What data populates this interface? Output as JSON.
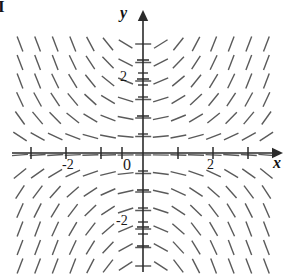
{
  "figure": {
    "tag": "I",
    "kind": "slope-field"
  },
  "axes": {
    "x_label": "x",
    "y_label": "y",
    "origin_label": "0",
    "x_ticks": [
      {
        "value": -4,
        "label": "",
        "px": 31
      },
      {
        "value": -3,
        "label": "",
        "px": 66
      },
      {
        "value": -2,
        "label": "-2",
        "px": 101
      },
      {
        "value": -1,
        "label": "",
        "px": 122
      },
      {
        "value": 1,
        "label": "",
        "px": 178
      },
      {
        "value": 2,
        "label": "2",
        "px": 213
      },
      {
        "value": 3,
        "label": "",
        "px": 248
      }
    ],
    "y_ticks": [
      {
        "value": 3,
        "label": "",
        "px": 60
      },
      {
        "value": 2,
        "label": "2",
        "px": 79
      },
      {
        "value": 1,
        "label": "",
        "px": 116
      },
      {
        "value": -1,
        "label": "",
        "px": 190
      },
      {
        "value": -2,
        "label": "-2",
        "px": 227
      },
      {
        "value": -3,
        "label": "",
        "px": 246
      }
    ],
    "x_tick_labels": [
      "-2",
      "2"
    ],
    "y_tick_labels": [
      "2",
      "-2"
    ]
  },
  "chart_data": {
    "type": "scatter",
    "subtype": "slope-field",
    "title": "",
    "xlabel": "x",
    "ylabel": "y",
    "xlim": [
      -3.6,
      3.6
    ],
    "ylim": [
      -3.2,
      3.2
    ],
    "grid": false,
    "legend": null,
    "equation_text": "dy/dx = x*y",
    "annotations": [
      "I"
    ],
    "segment_grid": {
      "x_start_px": 20,
      "x_step_px": 17.6,
      "x_count": 15,
      "y_start_px": 44,
      "y_step_px": 18.5,
      "y_count": 13,
      "segment_half_length_px": 8.0,
      "color": "#5a5a5a",
      "line_width": 1.4,
      "origin_px": {
        "x": 143,
        "y": 153
      },
      "scale_px_per_unit": {
        "x": 35,
        "y": 37
      },
      "slope_gain": 0.42,
      "slope_clip": 2.6
    }
  },
  "style": {
    "axis_color": "#2b2b2b",
    "segment_color": "#5a5a5a",
    "background": "#ffffff",
    "text_color": "#151515"
  }
}
